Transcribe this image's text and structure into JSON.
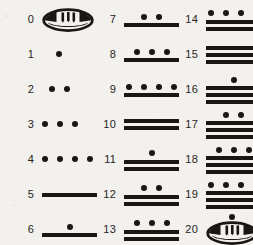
{
  "colors": {
    "ink": "#191715",
    "label_ink": "#262421",
    "paper": "#f3f1ee"
  },
  "glyph_legend": {
    "dot": "dot-glyph",
    "bar": "bar-glyph",
    "shell": "shell-glyph"
  },
  "columns": [
    {
      "index": 0,
      "entries": [
        {
          "label": "0",
          "value": 0,
          "type": "shell",
          "dots": 0,
          "bars": 0,
          "shell_dot": false
        },
        {
          "label": "1",
          "value": 1,
          "type": "dots-bars",
          "dots": 1,
          "bars": 0,
          "shell_dot": false
        },
        {
          "label": "2",
          "value": 2,
          "type": "dots-bars",
          "dots": 2,
          "bars": 0,
          "shell_dot": false
        },
        {
          "label": "3",
          "value": 3,
          "type": "dots-bars",
          "dots": 3,
          "bars": 0,
          "shell_dot": false
        },
        {
          "label": "4",
          "value": 4,
          "type": "dots-bars",
          "dots": 4,
          "bars": 0,
          "shell_dot": false
        },
        {
          "label": "5",
          "value": 5,
          "type": "dots-bars",
          "dots": 0,
          "bars": 1,
          "shell_dot": false
        },
        {
          "label": "6",
          "value": 6,
          "type": "dots-bars",
          "dots": 1,
          "bars": 1,
          "shell_dot": false
        }
      ]
    },
    {
      "index": 1,
      "entries": [
        {
          "label": "7",
          "value": 7,
          "type": "dots-bars",
          "dots": 2,
          "bars": 1,
          "shell_dot": false
        },
        {
          "label": "8",
          "value": 8,
          "type": "dots-bars",
          "dots": 3,
          "bars": 1,
          "shell_dot": false
        },
        {
          "label": "9",
          "value": 9,
          "type": "dots-bars",
          "dots": 4,
          "bars": 1,
          "shell_dot": false
        },
        {
          "label": "10",
          "value": 10,
          "type": "dots-bars",
          "dots": 0,
          "bars": 2,
          "shell_dot": false
        },
        {
          "label": "11",
          "value": 11,
          "type": "dots-bars",
          "dots": 1,
          "bars": 2,
          "shell_dot": false
        },
        {
          "label": "12",
          "value": 12,
          "type": "dots-bars",
          "dots": 2,
          "bars": 2,
          "shell_dot": false
        },
        {
          "label": "13",
          "value": 13,
          "type": "dots-bars",
          "dots": 3,
          "bars": 2,
          "shell_dot": false
        }
      ]
    },
    {
      "index": 2,
      "entries": [
        {
          "label": "14",
          "value": 14,
          "type": "dots-bars",
          "dots": 4,
          "bars": 2,
          "shell_dot": false
        },
        {
          "label": "15",
          "value": 15,
          "type": "dots-bars",
          "dots": 0,
          "bars": 3,
          "shell_dot": false
        },
        {
          "label": "16",
          "value": 16,
          "type": "dots-bars",
          "dots": 1,
          "bars": 3,
          "shell_dot": false
        },
        {
          "label": "17",
          "value": 17,
          "type": "dots-bars",
          "dots": 2,
          "bars": 3,
          "shell_dot": false
        },
        {
          "label": "18",
          "value": 18,
          "type": "dots-bars",
          "dots": 3,
          "bars": 3,
          "shell_dot": false
        },
        {
          "label": "19",
          "value": 19,
          "type": "dots-bars",
          "dots": 4,
          "bars": 3,
          "shell_dot": false
        },
        {
          "label": "20",
          "value": 20,
          "type": "shell",
          "dots": 0,
          "bars": 0,
          "shell_dot": true
        }
      ]
    }
  ]
}
